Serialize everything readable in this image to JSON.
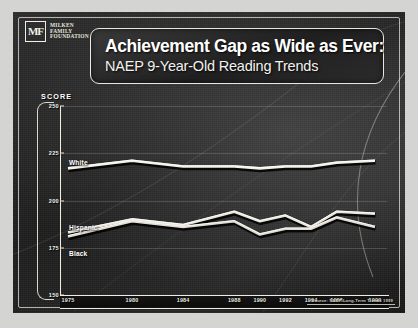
{
  "slide": {
    "logo": {
      "monogram": "MF",
      "line1": "Milken",
      "line2": "Family",
      "line3": "Foundation"
    },
    "title": {
      "main": "Achievement Gap as Wide as Ever:",
      "sub": "NAEP 9-Year-Old Reading Trends"
    },
    "source": "Source: NAEP Long-Term Trends 1999"
  },
  "colors": {
    "slide_background": "#1e1e1e",
    "frame": "#e8e8e0",
    "title_text": "#ffffff",
    "axis": "#f0ece2",
    "line_white_series": "#f2f0e8",
    "line_hispanic_series": "#e8e6dc",
    "line_black_series": "#dedad0",
    "gridline": "#3a3a38"
  },
  "chart_data": {
    "type": "line",
    "title": "Achievement Gap as Wide as Ever: NAEP 9-Year-Old Reading Trends",
    "subtitle": "NAEP 9-Year-Old Reading Trends",
    "xlabel": "",
    "ylabel": "SCORE",
    "ylim": [
      150,
      250
    ],
    "yticks": [
      250,
      225,
      200,
      175,
      150
    ],
    "grid": true,
    "legend_position": "inline-labels",
    "x": [
      1975,
      1980,
      1984,
      1988,
      1990,
      1992,
      1994,
      1996,
      1999
    ],
    "categories": [
      "1975",
      "1980",
      "1984",
      "1988",
      "1990",
      "1992",
      "1994",
      "1996",
      "1999"
    ],
    "series": [
      {
        "name": "White",
        "label": "White",
        "values": [
          217,
          221,
          218,
          218,
          217,
          218,
          218,
          220,
          221
        ]
      },
      {
        "name": "Hispanic",
        "label": "Hispanic",
        "values": [
          183,
          190,
          187,
          194,
          189,
          192,
          186,
          194,
          193
        ]
      },
      {
        "name": "Black",
        "label": "Black",
        "values": [
          181,
          189,
          186,
          189,
          182,
          185,
          185,
          191,
          186
        ]
      }
    ],
    "annotations": [
      "Source: NAEP Long-Term Trends 1999"
    ]
  }
}
